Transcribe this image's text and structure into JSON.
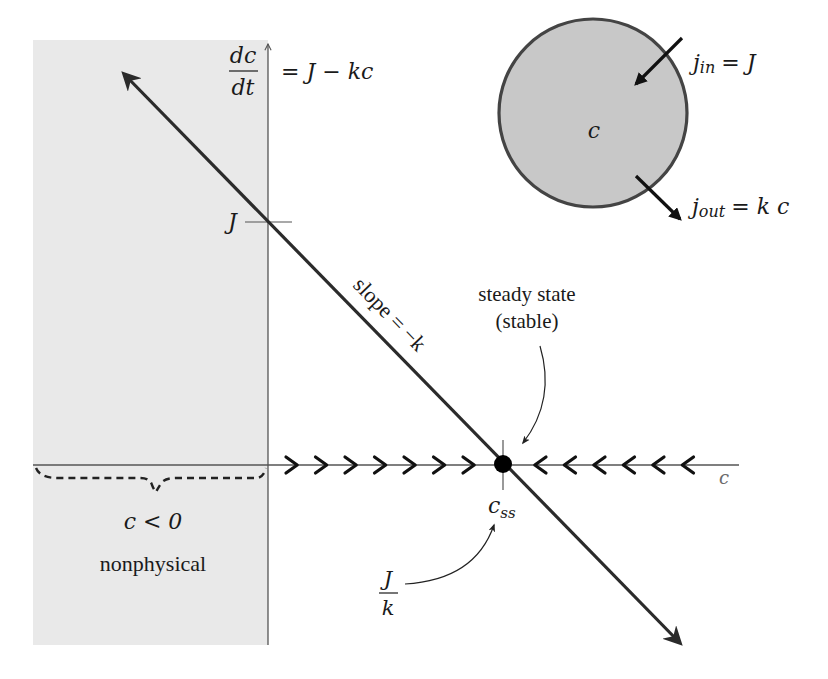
{
  "diagram": {
    "colors": {
      "nonphysical_region": "#e9e9e9",
      "axis": "#555555",
      "line": "#2b2b2b",
      "circle_fill": "#c8c8c8",
      "circle_stroke": "#444444",
      "text": "#1a1a1a",
      "axis_label": "#6b6b6b"
    },
    "equation": {
      "lhs_numerator": "dc",
      "lhs_denominator": "dt",
      "rhs": "= J − kc"
    },
    "y_axis_tick_label": "J",
    "x_axis_label": "c",
    "line_label": "slope = −k",
    "steady_state": {
      "label_line1": "steady state",
      "label_line2": "(stable)",
      "point_label": "c",
      "point_label_subscript": "ss",
      "value_label_numerator": "J",
      "value_label_denominator": "k"
    },
    "nonphysical": {
      "condition": "c < 0",
      "label": "nonphysical"
    },
    "flow_arrows": {
      "right_pointing_count": 7,
      "left_pointing_count": 6
    },
    "compartment": {
      "center_label": "c",
      "influx_label": "j",
      "influx_subscript": "in",
      "influx_rhs": "= J",
      "efflux_label": "j",
      "efflux_subscript": "out",
      "efflux_rhs": "= k c"
    }
  }
}
